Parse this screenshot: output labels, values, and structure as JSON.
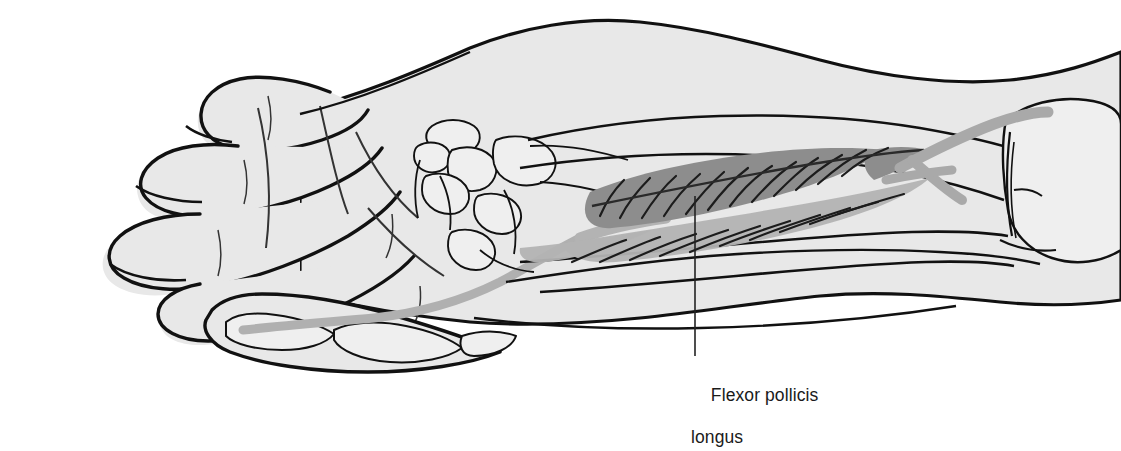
{
  "figure": {
    "type": "anatomical-illustration",
    "view": "right forearm and hand, anterior (palmar) view, radial side",
    "background_color": "#ffffff",
    "skin_fill_color": "#e8e8e8",
    "bone_fill_color": "#efefef",
    "outline_color": "#111111",
    "muscle_belly_color": "#8d8d8d",
    "muscle_aponeurosis_color": "#b3b3b3",
    "tendon_color": "#b0b0b0",
    "leader_line_color": "#222222"
  },
  "labels": [
    {
      "id": "flexor-pollicis-longus",
      "line1": "Flexor pollicis",
      "line2": "longus",
      "x": 691,
      "y": 364,
      "leader": {
        "from_x": 695,
        "from_y": 196,
        "to_x": 695,
        "to_y": 356
      }
    }
  ],
  "structures": [
    {
      "name": "hand-fingers-flexed",
      "label": ""
    },
    {
      "name": "palm",
      "label": ""
    },
    {
      "name": "thumb-phalanges",
      "label": ""
    },
    {
      "name": "carpal-bones",
      "label": ""
    },
    {
      "name": "radius",
      "label": ""
    },
    {
      "name": "ulna",
      "label": ""
    },
    {
      "name": "humerus",
      "label": ""
    },
    {
      "name": "flexor-pollicis-longus-muscle-belly",
      "label": ""
    },
    {
      "name": "flexor-pollicis-longus-tendon",
      "label": ""
    }
  ]
}
